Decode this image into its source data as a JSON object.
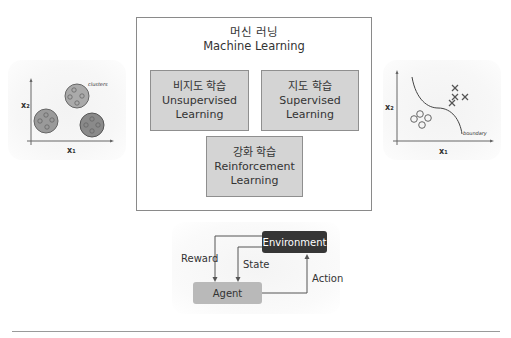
{
  "machine_learning": {
    "title_ko": "머신 러닝",
    "title_en": "Machine Learning",
    "categories": [
      {
        "ko": "비지도 학습",
        "en_line1": "Unsupervised",
        "en_line2": "Learning"
      },
      {
        "ko": "지도 학습",
        "en_line1": "Supervised",
        "en_line2": "Learning"
      },
      {
        "ko": "강화 학습",
        "en_line1": "Reinforcement",
        "en_line2": "Learning"
      }
    ]
  },
  "clustering_plot": {
    "x_label": "x₁",
    "y_label": "x₂",
    "annotation": "clusters"
  },
  "classification_plot": {
    "x_label": "x₁",
    "y_label": "x₂",
    "annotation": "boundary"
  },
  "reinforcement_loop": {
    "environment": "Environment",
    "agent": "Agent",
    "reward": "Reward",
    "state": "State",
    "action": "Action"
  },
  "colors": {
    "box_fill": "#d4d4d4",
    "environment_fill": "#363636",
    "agent_fill": "#b9b9b9",
    "cluster_fill": "#9a9a9a"
  }
}
